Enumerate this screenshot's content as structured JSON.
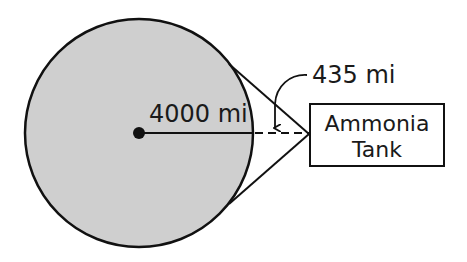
{
  "diagram": {
    "radius_label": "4000 mi",
    "distance_label": "435 mi",
    "tank_label_line1": "Ammonia",
    "tank_label_line2": "Tank",
    "colors": {
      "planet_fill": "#cfcfcf",
      "stroke": "#111111",
      "background": "#ffffff"
    }
  }
}
